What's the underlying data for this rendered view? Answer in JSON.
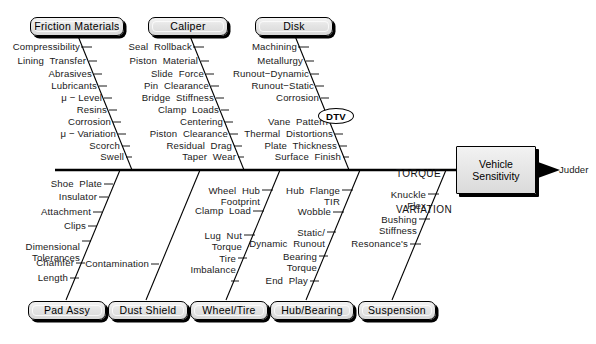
{
  "diagram": {
    "effect": {
      "line1": "Vehicle",
      "line2": "Sensitivity"
    },
    "outcome_label": "Judder",
    "spine_label_line1": "TORQUE",
    "spine_label_line2": "VARIATION",
    "highlight_label": "DTV"
  },
  "categories_top": [
    {
      "id": "friction-materials",
      "label": "Friction  Materials"
    },
    {
      "id": "caliper",
      "label": "Caliper"
    },
    {
      "id": "disk",
      "label": "Disk"
    }
  ],
  "categories_bottom": [
    {
      "id": "pad-assy",
      "label": "Pad  Assy"
    },
    {
      "id": "dust-shield",
      "label": "Dust  Shield"
    },
    {
      "id": "wheel-tire",
      "label": "Wheel/Tire"
    },
    {
      "id": "hub-bearing",
      "label": "Hub/Bearing"
    },
    {
      "id": "suspension",
      "label": "Suspension"
    }
  ],
  "causes": {
    "friction_materials": [
      "Compressibility",
      "Lining  Transfer",
      "Abrasives",
      "Lubricants",
      "μ − Level",
      "Resins",
      "Corrosion",
      "μ − Variation",
      "Scorch",
      "Swell"
    ],
    "caliper": [
      "Seal  Rollback",
      "Piston  Material",
      "Slide  Force",
      "Pin  Clearance",
      "Bridge  Stiffness",
      "Clamp  Loads",
      "Centering",
      "Piston  Clearance",
      "Residual  Drag",
      "Taper  Wear"
    ],
    "disk": [
      "Machining",
      "Metallurgy",
      "Runout−Dynamic",
      "Runout−Static",
      "Corrosion",
      "DTV",
      "Vane  Pattern",
      "Thermal  Distortions",
      "Plate  Thickness",
      "Surface  Finish"
    ],
    "pad_assy": [
      "Shoe  Plate",
      "Insulator",
      "Attachment",
      "Clips",
      "Dimensional\nTolerances",
      "Chamfer",
      "Length"
    ],
    "dust_shield": [
      "Contamination"
    ],
    "wheel_tire": [
      "Wheel  Hub\nFootprint",
      "Clamp  Load",
      "Lug  Nut\nTorque",
      "Tire\nImbalance"
    ],
    "hub_bearing": [
      "Hub  Flange\nTIR",
      "Wobble",
      "Static/\nDynamic  Runout",
      "Bearing\nTorque",
      "End  Play"
    ],
    "suspension": [
      "Knuckle\nFlex",
      "Bushing\nStiffness",
      "Resonance's"
    ]
  },
  "colors": {
    "line": "#000000",
    "text": "#1a1a1a",
    "box_fill": "#e6e6e6",
    "background": "#ffffff"
  }
}
